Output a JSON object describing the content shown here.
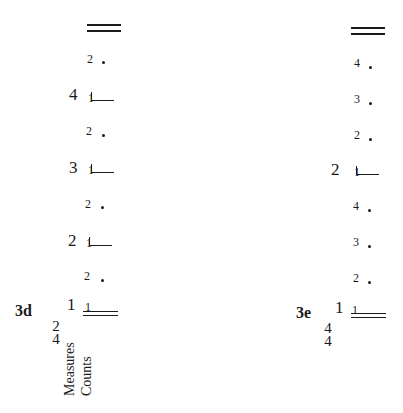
{
  "diagrams": [
    {
      "id": "3d",
      "label": "3d",
      "time_signature": {
        "top": "2",
        "bottom": "4"
      },
      "row_labels": [
        "Measures",
        "Counts"
      ],
      "levels_top_to_bottom": [
        {
          "type": "double-barline"
        },
        {
          "type": "beat",
          "count": "2"
        },
        {
          "type": "measure",
          "measure": "4",
          "count": "1"
        },
        {
          "type": "beat",
          "count": "2"
        },
        {
          "type": "measure",
          "measure": "3",
          "count": "1"
        },
        {
          "type": "beat",
          "count": "2"
        },
        {
          "type": "measure",
          "measure": "2",
          "count": "1"
        },
        {
          "type": "beat",
          "count": "2"
        },
        {
          "type": "measure-start",
          "measure": "1",
          "count": "1"
        }
      ]
    },
    {
      "id": "3e",
      "label": "3e",
      "time_signature": {
        "top": "4",
        "bottom": "4"
      },
      "levels_top_to_bottom": [
        {
          "type": "double-barline"
        },
        {
          "type": "beat",
          "count": "4"
        },
        {
          "type": "beat",
          "count": "3"
        },
        {
          "type": "beat",
          "count": "2"
        },
        {
          "type": "measure",
          "measure": "2",
          "count": "1"
        },
        {
          "type": "beat",
          "count": "4"
        },
        {
          "type": "beat",
          "count": "3"
        },
        {
          "type": "beat",
          "count": "2"
        },
        {
          "type": "measure-start",
          "measure": "1",
          "count": "1"
        }
      ]
    }
  ],
  "left": {
    "label": "3d",
    "ts_top": "2",
    "ts_bottom": "4",
    "row_measures": "Measures",
    "row_counts": "Counts",
    "beat_count": "2",
    "m4": "4",
    "m3": "3",
    "m2": "2",
    "m1": "1",
    "one": "1"
  },
  "right": {
    "label": "3e",
    "ts_top": "4",
    "ts_bottom": "4",
    "c4": "4",
    "c3": "3",
    "c2": "2",
    "m2": "2",
    "m1": "1",
    "one": "1"
  }
}
